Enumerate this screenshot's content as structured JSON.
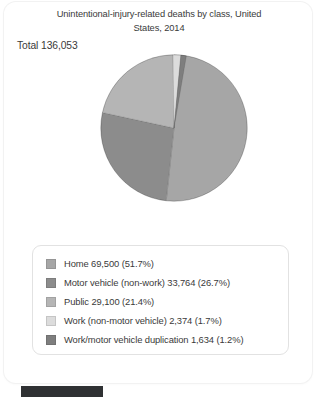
{
  "card": {
    "title_line1": "Unintentional-injury-related deaths by class, United",
    "title_line2": "States, 2014",
    "total_label": "Total 136,053"
  },
  "chart_data": {
    "type": "pie",
    "title": "Unintentional-injury-related deaths by class, United States, 2014",
    "total": 136053,
    "total_label": "Total 136,053",
    "legend_position": "bottom",
    "start_angle_deg": 0,
    "direction": "clockwise",
    "categories": [
      "Home",
      "Motor vehicle (non-work)",
      "Public",
      "Work (non-motor vehicle)",
      "Work/motor vehicle duplication"
    ],
    "values": [
      69500,
      33764,
      29100,
      2374,
      1634
    ],
    "percents": [
      51.7,
      26.7,
      21.4,
      1.7,
      1.2
    ],
    "colors": [
      "#a6a6a6",
      "#8c8c8c",
      "#b5b5b5",
      "#dcdcdc",
      "#7e7e7e"
    ],
    "slices": [
      {
        "label": "Home",
        "value": 69500,
        "value_text": "69,500",
        "percent": 51.7,
        "percent_text": "(51.7%)",
        "color": "#a6a6a6",
        "legend_text": "Home  69,500  (51.7%)"
      },
      {
        "label": "Motor vehicle (non-work)",
        "value": 33764,
        "value_text": "33,764",
        "percent": 26.7,
        "percent_text": "(26.7%)",
        "color": "#8c8c8c",
        "legend_text": "Motor vehicle (non-work) 33,764  (26.7%)"
      },
      {
        "label": "Public",
        "value": 29100,
        "value_text": "29,100",
        "percent": 21.4,
        "percent_text": "(21.4%)",
        "color": "#b5b5b5",
        "legend_text": "Public  29,100  (21.4%)"
      },
      {
        "label": "Work (non-motor vehicle)",
        "value": 2374,
        "value_text": "2,374",
        "percent": 1.7,
        "percent_text": "(1.7%)",
        "color": "#dcdcdc",
        "legend_text": "Work (non-motor vehicle)  2,374  (1.7%)"
      },
      {
        "label": "Work/motor vehicle duplication",
        "value": 1634,
        "value_text": "1,634",
        "percent": 1.2,
        "percent_text": "(1.2%)",
        "color": "#7e7e7e",
        "legend_text": "Work/motor vehicle duplication  1,634  (1.2%)"
      }
    ]
  },
  "footer": {
    "tag_color": "#2f3133"
  }
}
